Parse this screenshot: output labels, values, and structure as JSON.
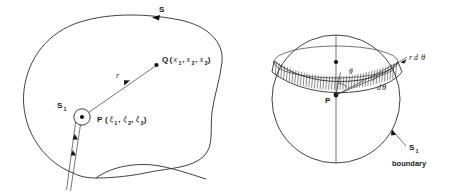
{
  "figure": {
    "title": "",
    "colors": {
      "line": "#2b2b2b",
      "text": "#1a1a1a",
      "background": "#ffffff"
    }
  },
  "left_panel": {
    "name": "irregular-region-with-slit",
    "labels": {
      "outer_surface": "S",
      "inner_surface": "S",
      "inner_surface_sub": "1",
      "radius_vector": "r",
      "point_q": "Q",
      "point_q_open": "(",
      "point_q_x1": "x",
      "point_q_x1_sub": "1",
      "point_q_comma1": ",",
      "point_q_x2": "x",
      "point_q_x2_sub": "2",
      "point_q_comma2": ",",
      "point_q_x3": "x",
      "point_q_x3_sub": "3",
      "point_q_close": ")",
      "point_p": "P",
      "point_p_open": "(",
      "point_p_xi1": "ξ",
      "point_p_xi1_sub": "1",
      "point_p_comma1": ",",
      "point_p_xi2": "ξ",
      "point_p_xi2_sub": "2",
      "point_p_comma2": ",",
      "point_p_xi3": "ξ",
      "point_p_xi3_sub": "3",
      "point_p_close": ")"
    }
  },
  "right_panel": {
    "name": "sphere-with-hatched-band",
    "labels": {
      "point_p": "P",
      "arc_length": "r d",
      "arc_length_theta": "θ",
      "angle_theta": "θ",
      "differential_angle": "d",
      "differential_angle_theta": "θ",
      "boundary_surface": "S",
      "boundary_surface_sub": "1",
      "boundary_word": "boundary"
    }
  },
  "geometry": {
    "left_region_type": "closed irregular curve with circular cavity and radial slit",
    "right_sphere_center_x": 336,
    "right_sphere_center_y": 99,
    "right_sphere_radius": 64,
    "hatch_count": 44
  }
}
